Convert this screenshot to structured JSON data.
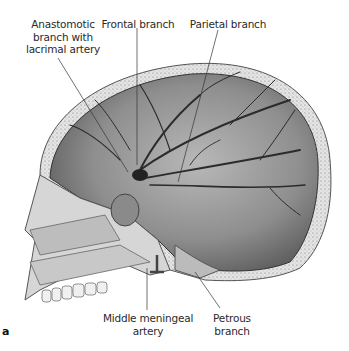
{
  "figure": {
    "panel_letter": "a",
    "labels": {
      "anastomotic": [
        "Anastomotic",
        "branch with",
        "lacrimal artery"
      ],
      "frontal": "Frontal branch",
      "parietal": "Parietal branch",
      "middle_meningeal": [
        "Middle meningeal",
        "artery"
      ],
      "petrous": "Petrous branch"
    }
  }
}
